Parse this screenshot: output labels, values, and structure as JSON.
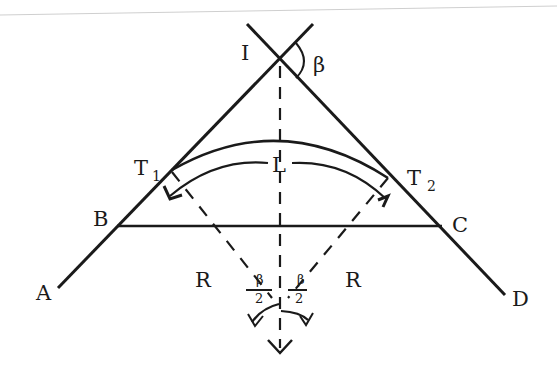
{
  "diagram": {
    "title": "",
    "type": "simple circular curve geometry",
    "colors": {
      "line": "#1a1a1a",
      "background": "#ffffff",
      "top_rule": "#c8c8c8"
    },
    "points": {
      "I": {
        "label": "I"
      },
      "T1": {
        "label": "T",
        "subscript": "1"
      },
      "T2": {
        "label": "T",
        "subscript": "2"
      },
      "B": {
        "label": "B"
      },
      "C": {
        "label": "C"
      },
      "A": {
        "label": "A"
      },
      "D": {
        "label": "D"
      }
    },
    "labels": {
      "deflection_angle": "β",
      "curve_length": "L",
      "radius_left": "R",
      "radius_right": "R",
      "half_angle_left": {
        "numerator": "β",
        "denominator": "2"
      },
      "half_angle_right": {
        "numerator": "β",
        "denominator": "2"
      }
    },
    "elements": [
      "tangent line A–B–T1–I (back tangent)",
      "tangent line I–T2–C–D (forward tangent)",
      "chord B–C",
      "circular arc T1–T2",
      "double-headed arrow arc labeled L",
      "dashed bisector from I to curve center",
      "dashed radii R from T1 and T2 to center",
      "angle arcs β/2 at center"
    ]
  }
}
